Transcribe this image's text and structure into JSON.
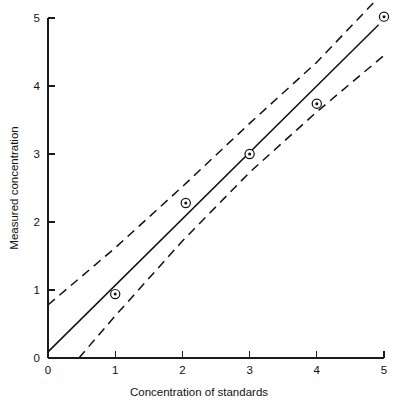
{
  "chart_data": {
    "type": "scatter",
    "title": "",
    "xlabel": "Concentration of standards",
    "ylabel": "Measured concentration",
    "xlim": [
      0,
      5
    ],
    "ylim": [
      0,
      5
    ],
    "xticks": [
      0,
      1,
      2,
      3,
      4,
      5
    ],
    "yticks": [
      0,
      1,
      2,
      3,
      4,
      5
    ],
    "xtick_labels": [
      "0",
      "1",
      "2",
      "3",
      "4",
      "5"
    ],
    "ytick_labels": [
      "0",
      "1",
      "2",
      "3",
      "4",
      "5"
    ],
    "grid": false,
    "legend": "none",
    "marker_style": "circle-with-center-dot",
    "points": [
      {
        "x": 1.0,
        "y": 0.94
      },
      {
        "x": 2.05,
        "y": 2.28
      },
      {
        "x": 3.0,
        "y": 3.0
      },
      {
        "x": 4.0,
        "y": 3.74
      },
      {
        "x": 5.0,
        "y": 5.02
      }
    ],
    "series": [
      {
        "name": "Regression line",
        "style": "solid",
        "points": [
          {
            "x": 0.0,
            "y": 0.09
          },
          {
            "x": 4.92,
            "y": 4.9
          }
        ]
      },
      {
        "name": "Upper confidence band",
        "style": "dashed",
        "points": [
          {
            "x": 0.0,
            "y": 0.78
          },
          {
            "x": 1.0,
            "y": 1.62
          },
          {
            "x": 2.0,
            "y": 2.52
          },
          {
            "x": 3.0,
            "y": 3.45
          },
          {
            "x": 4.0,
            "y": 4.35
          },
          {
            "x": 4.84,
            "y": 5.22
          }
        ]
      },
      {
        "name": "Lower confidence band",
        "style": "dashed",
        "points": [
          {
            "x": 0.46,
            "y": 0.0
          },
          {
            "x": 1.0,
            "y": 0.62
          },
          {
            "x": 2.0,
            "y": 1.72
          },
          {
            "x": 3.0,
            "y": 2.73
          },
          {
            "x": 4.0,
            "y": 3.62
          },
          {
            "x": 5.0,
            "y": 4.45
          }
        ]
      }
    ],
    "colors": {
      "axis": "#1a1a1a",
      "line": "#111111",
      "marker_fill": "#ffffff",
      "background": "#ffffff"
    }
  }
}
